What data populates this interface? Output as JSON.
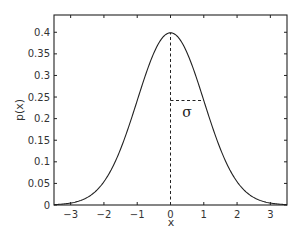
{
  "chart_data": {
    "type": "line",
    "title": "",
    "xlabel": "x",
    "ylabel": "p(x)",
    "xlim": [
      -3.5,
      3.5
    ],
    "ylim": [
      0,
      0.44
    ],
    "grid": false,
    "legend": null,
    "x_ticks": [
      -3,
      -2,
      -1,
      0,
      1,
      2,
      3
    ],
    "x_tick_labels": [
      "−3",
      "−2",
      "−1",
      "0",
      "1",
      "2",
      "3"
    ],
    "y_ticks": [
      0,
      0.05,
      0.1,
      0.15,
      0.2,
      0.25,
      0.3,
      0.35,
      0.4
    ],
    "y_tick_labels": [
      "0",
      "0.05",
      "0.1",
      "0.15",
      "0.2",
      "0.25",
      "0.3",
      "0.35",
      "0.4"
    ],
    "series": [
      {
        "name": "standard normal pdf",
        "function": "p(x) = exp(-x^2/2)/sqrt(2*pi)",
        "x": [
          -3.5,
          -3,
          -2.5,
          -2,
          -1.5,
          -1,
          -0.5,
          0,
          0.5,
          1,
          1.5,
          2,
          2.5,
          3,
          3.5
        ],
        "values": [
          0.0009,
          0.0044,
          0.0175,
          0.054,
          0.1295,
          0.242,
          0.3521,
          0.3989,
          0.3521,
          0.242,
          0.1295,
          0.054,
          0.0175,
          0.0044,
          0.0009
        ]
      }
    ],
    "annotations": [
      {
        "type": "dashed-vline",
        "x": 0,
        "y_from": 0,
        "y_to": 0.3989,
        "label": "mean"
      },
      {
        "type": "dashed-hline",
        "y": 0.242,
        "x_from": 0,
        "x_to": 1,
        "label": "σ"
      }
    ],
    "sigma_label": "σ"
  }
}
